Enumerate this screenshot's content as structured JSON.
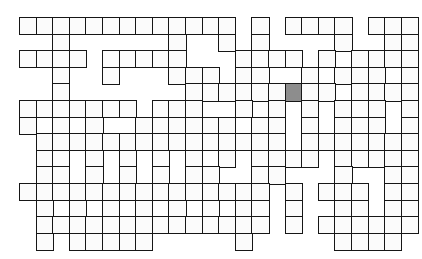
{
  "puzzle": {
    "title": "Crossword Grid",
    "type": "crossword-blank-grid",
    "description": "Empty crossword puzzle grid of interlocking white cells with black borders on a white page; one cell is shaded gray.",
    "geometry": {
      "origin_x": 19,
      "origin_y": 17,
      "cell_size": 16.6,
      "border_width": 1.6,
      "columns": 24,
      "rows": 14
    },
    "colors": {
      "page_background": "#ffffff",
      "cell_fill": "#fbfbfb",
      "cell_border": "#161616",
      "highlight_fill": "#8d8d8d"
    },
    "highlight_cell": {
      "row": 4,
      "col": 16,
      "label": "shaded-cell"
    },
    "legend": {
      "filled": "1 = open playable cell",
      "empty": "0 = blank page area (no cell)"
    },
    "grid": [
      "111111111111101011110111",
      "001000000100101000010011",
      "111101111100011110101111",
      "001001000111011001011101",
      "001000000011111111101111",
      "111111101110010101011101",
      "101010011111101101011101",
      "011111111111111101111111",
      "011010101010101111011111",
      "011010101011001100010011",
      "111111111111111010111011",
      "010101010101011010011011",
      "011111111111111010111111",
      "010111110000010000011110"
    ]
  }
}
